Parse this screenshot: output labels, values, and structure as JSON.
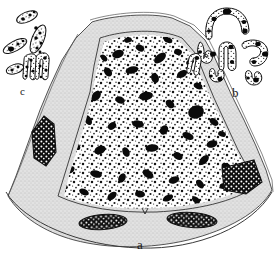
{
  "figure": {
    "medium": "ink line drawing, stipple shading",
    "background_color": "#ffffff",
    "ink_color": "#111111",
    "wall_fill_color": "#dcdcdc",
    "cytoplasm_fill_color": "#ffffff",
    "panels": [
      {
        "id": "a",
        "label": "a",
        "description": "large cell / nucleus cross-section, domed outline with granular chromatin interior",
        "label_x": 137,
        "label_y": 238
      },
      {
        "id": "b",
        "label": "b",
        "description": "group of curved V-shaped chromosomes with dark heterochromatin blocks",
        "chromosome_count": 7,
        "label_x": 232,
        "label_y": 86
      },
      {
        "id": "c",
        "label": "c",
        "description": "group of elongated rod-shaped chromosomes with fine stipple",
        "chromosome_count": 6,
        "label_x": 20,
        "label_y": 86
      }
    ]
  },
  "panel_a": {
    "outer_wall_label": "outer wall / cortex",
    "inner_body_label": "chromatin mass",
    "embedded_bodies": [
      {
        "name": "left-wall-body",
        "x": 40,
        "y": 140
      },
      {
        "name": "right-wall-body",
        "x": 238,
        "y": 180
      },
      {
        "name": "bottom-left-body",
        "x": 100,
        "y": 222
      },
      {
        "name": "bottom-right-body",
        "x": 190,
        "y": 220
      }
    ]
  },
  "panel_b": {
    "chromosomes": [
      {
        "id": "b1",
        "shape": "arch",
        "cx": 225,
        "cy": 22,
        "blocks": 4
      },
      {
        "id": "b2",
        "shape": "comma",
        "cx": 207,
        "cy": 50,
        "blocks": 2
      },
      {
        "id": "b3",
        "shape": "rod",
        "cx": 232,
        "cy": 55,
        "blocks": 2
      },
      {
        "id": "b4",
        "shape": "hook",
        "cx": 255,
        "cy": 50,
        "blocks": 3
      },
      {
        "id": "b5",
        "shape": "comma",
        "cx": 216,
        "cy": 74,
        "blocks": 2
      },
      {
        "id": "b6",
        "shape": "comma",
        "cx": 253,
        "cy": 76,
        "blocks": 2
      },
      {
        "id": "b7",
        "shape": "rod",
        "cx": 200,
        "cy": 70,
        "blocks": 1
      }
    ]
  },
  "panel_c": {
    "chromosomes": [
      {
        "id": "c1",
        "shape": "rod",
        "cx": 27,
        "cy": 18,
        "blocks": 3
      },
      {
        "id": "c2",
        "shape": "rod",
        "cx": 38,
        "cy": 40,
        "blocks": 6
      },
      {
        "id": "c3",
        "shape": "rod",
        "cx": 14,
        "cy": 47,
        "blocks": 3
      },
      {
        "id": "c4",
        "shape": "rod",
        "cx": 14,
        "cy": 68,
        "blocks": 3
      },
      {
        "id": "c5",
        "shape": "dumbbell",
        "cx": 35,
        "cy": 68,
        "blocks": 5
      },
      {
        "id": "c6",
        "shape": "dumbbell",
        "cx": 44,
        "cy": 66,
        "blocks": 5
      }
    ]
  }
}
